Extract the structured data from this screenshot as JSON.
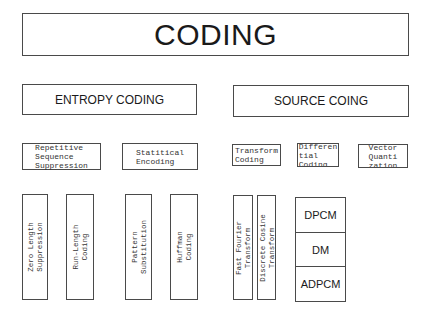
{
  "title": "CODING",
  "categories": {
    "entropy": "ENTROPY CODING",
    "source": "SOURCE COING"
  },
  "entropy_subcategories": {
    "repetitive": "Repetitive\nSequence\nSuppression",
    "statistical": "Statitical\nEncoding"
  },
  "source_subcategories": {
    "transform": "Transform\nCoding",
    "differential": "Differen\ntial\nCoding",
    "vector": "Vector\nQuanti\nzation"
  },
  "entropy_methods": {
    "zero_length": "Zero Length\nSuppression",
    "run_length": "Run-Length\nCoding",
    "pattern": "Pattern\nSubstitution",
    "huffman": "Huffman\nCoding"
  },
  "transform_methods": {
    "fft": "Fast Fourier\nTransform",
    "dct": "Discrete Cosine\nTransform"
  },
  "differential_methods": [
    "DPCM",
    "DM",
    "ADPCM"
  ]
}
